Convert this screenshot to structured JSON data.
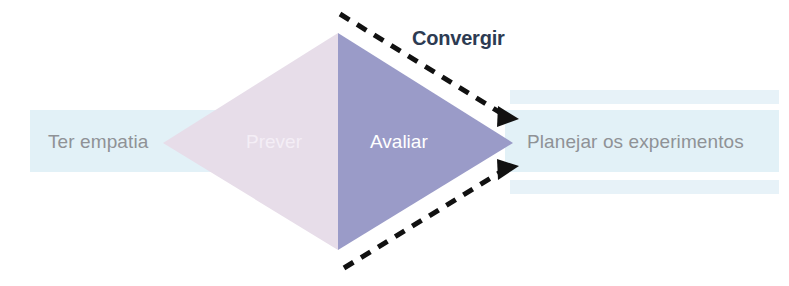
{
  "diagram": {
    "title_visible": false,
    "colors": {
      "band": "#ddeef6",
      "band_light": "#e8f3f9",
      "diamond_left": "#e7dde9",
      "diamond_right": "#9a9bc8",
      "arrow": "#111111",
      "gray_label": "#8f9296",
      "convergir_label": "#2d3b52",
      "white_label": "#ffffff",
      "pale_label": "#f4eef6",
      "background": "#ffffff"
    },
    "bands": [
      {
        "name": "left-band",
        "label": "Ter empatia",
        "label_color": "#8f9296"
      },
      {
        "name": "right-band-top-thin",
        "label": ""
      },
      {
        "name": "right-band-main",
        "label": "Planejar os experimentos",
        "label_color": "#8f9296"
      },
      {
        "name": "right-band-bottom-thin",
        "label": ""
      }
    ],
    "diamond": {
      "left_half_label": "Prever",
      "right_half_label": "Avaliar",
      "left_vertex": [
        163,
        143
      ],
      "top_vertex": [
        338,
        33
      ],
      "right_vertex": [
        513,
        143
      ],
      "bottom_vertex": [
        338,
        250
      ]
    },
    "annotation": {
      "label": "Convergir",
      "arrows": [
        {
          "name": "upper-converge-arrow",
          "from": [
            340,
            14
          ],
          "to": [
            513,
            122
          ],
          "style": "dashed"
        },
        {
          "name": "lower-converge-arrow",
          "from": [
            344,
            268
          ],
          "to": [
            513,
            162
          ],
          "style": "dashed"
        }
      ]
    }
  }
}
